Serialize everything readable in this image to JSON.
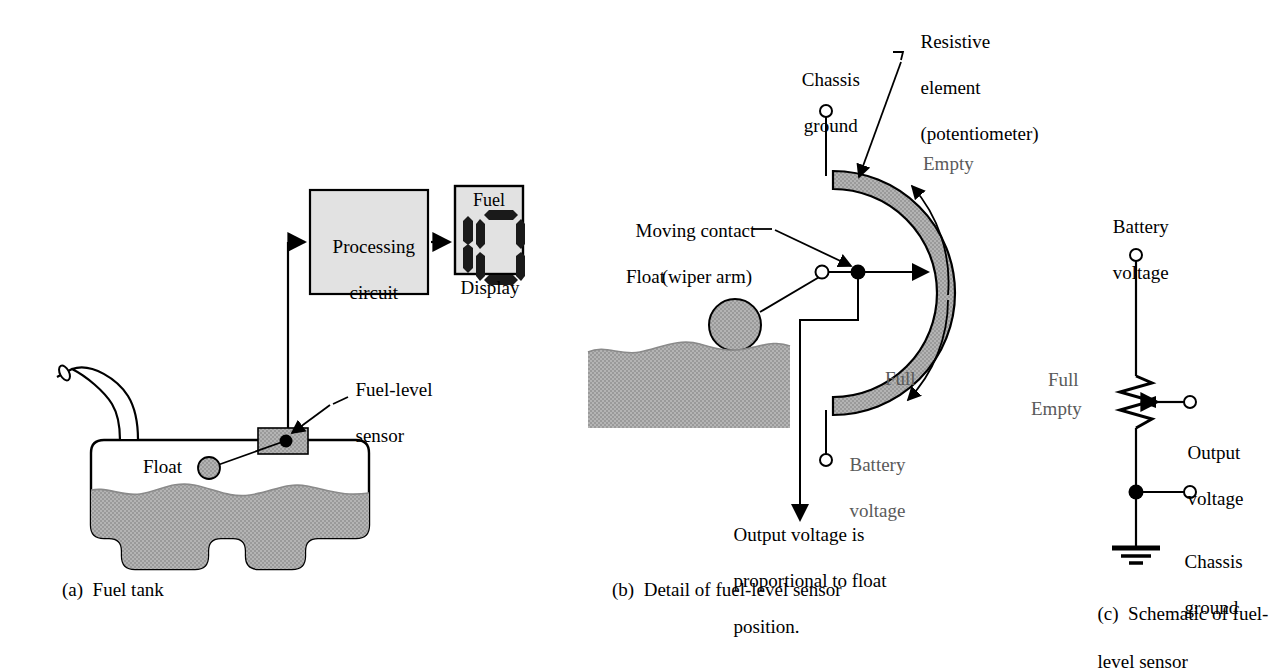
{
  "figure": {
    "colors": {
      "fill_gray": "#a9a9a9",
      "box_gray": "#e2e2e2",
      "stroke": "#000000",
      "label_gray": "#5a5a5a"
    }
  },
  "panel_a": {
    "caption": "(a)  Fuel tank",
    "processing_box": "Processing\ncircuit",
    "processing_line1": "Processing",
    "processing_line2": "circuit",
    "display_title": "Fuel",
    "display_caption": "Display",
    "display_value": "0",
    "sensor_label": "Fuel-level\nsensor",
    "sensor_label_line1": "Fuel-level",
    "sensor_label_line2": "sensor",
    "float_label": "Float"
  },
  "panel_b": {
    "caption": "(b)  Detail of fuel-level sensor",
    "chassis_ground": "Chassis\nground",
    "chassis_ground_line1": "Chassis",
    "chassis_ground_line2": "ground",
    "resistive_element": "Resistive\nelement\n(potentiometer)",
    "resistive_line1": "Resistive",
    "resistive_line2": "element",
    "resistive_line3": "(potentiometer)",
    "moving_contact": "Moving contact\n(wiper arm)",
    "moving_contact_line1": "Moving contact",
    "moving_contact_line2": "(wiper arm)",
    "float_label": "Float",
    "empty_label": "Empty",
    "full_label": "Full",
    "battery_voltage_line1": "Battery",
    "battery_voltage_line2": "voltage",
    "output_note": "Output voltage is\nproportional to float\nposition.",
    "output_note_line1": "Output voltage is",
    "output_note_line2": "proportional to float",
    "output_note_line3": "position."
  },
  "panel_c": {
    "caption": "(c)  Schematic of fuel-\nlevel sensor",
    "caption_line1": "(c)  Schematic of fuel-",
    "caption_line2": "level sensor",
    "battery_voltage_line1": "Battery",
    "battery_voltage_line2": "voltage",
    "full_label": "Full",
    "empty_label": "Empty",
    "output_voltage_line1": "Output",
    "output_voltage_line2": "voltage",
    "chassis_ground_line1": "Chassis",
    "chassis_ground_line2": "ground"
  }
}
